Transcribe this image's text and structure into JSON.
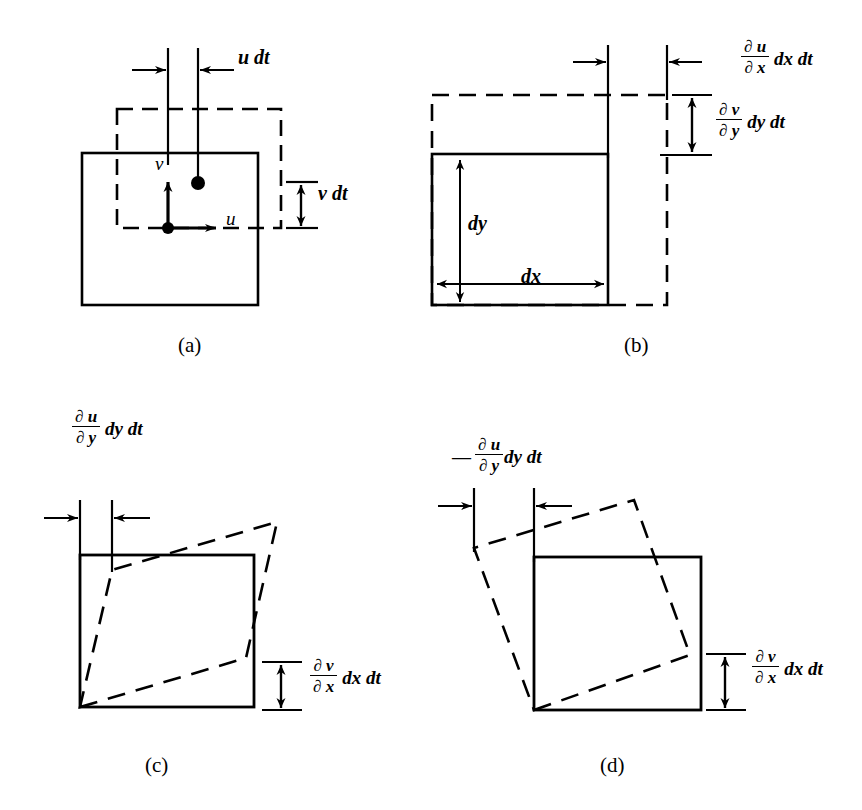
{
  "figure": {
    "background_color": "#ffffff",
    "ink_color": "#000000"
  },
  "panels": [
    {
      "id": "a",
      "caption": "(a)",
      "caption_pos": {
        "x": 178,
        "y": 345
      },
      "description": "translation",
      "solid_square": {
        "x": 82,
        "y": 153,
        "w": 176,
        "h": 152
      },
      "dashed_square": {
        "x": 117,
        "y": 109,
        "w": 164,
        "h": 119
      },
      "velocity_origin": {
        "x": 168,
        "y": 228
      },
      "displaced_point": {
        "x": 198,
        "y": 183
      },
      "labels": [
        {
          "name": "u-dt-label",
          "text": "u dt",
          "x": 238,
          "y": 56,
          "kind": "simple"
        },
        {
          "name": "v-dt-label",
          "text": "v dt",
          "x": 318,
          "y": 193,
          "kind": "simple"
        },
        {
          "name": "u-velocity-label",
          "text": "u",
          "x": 226,
          "y": 218,
          "kind": "vector"
        },
        {
          "name": "v-velocity-label",
          "text": "v",
          "x": 156,
          "y": 163,
          "kind": "vector"
        }
      ]
    },
    {
      "id": "b",
      "caption": "(b)",
      "caption_pos": {
        "x": 624,
        "y": 345
      },
      "description": "linear deformation",
      "solid_square": {
        "x": 432,
        "y": 154,
        "w": 176,
        "h": 151
      },
      "dashed_square": {
        "x": 432,
        "y": 95,
        "w": 235,
        "h": 210
      },
      "labels": [
        {
          "name": "du-dx-dxdt-label",
          "numerator": "∂ u",
          "denominator": "∂ x",
          "tail": "dx dt",
          "x": 741,
          "y": 47,
          "kind": "fraction"
        },
        {
          "name": "dv-dy-dydt-label",
          "numerator": "∂ v",
          "denominator": "∂ y",
          "tail": "dy dt",
          "x": 716,
          "y": 110,
          "kind": "fraction"
        },
        {
          "name": "dy-dimension-label",
          "text": "dy",
          "x": 452,
          "y": 222,
          "kind": "simple"
        },
        {
          "name": "dx-dimension-label",
          "text": "dx",
          "x": 521,
          "y": 276,
          "kind": "simple"
        }
      ]
    },
    {
      "id": "c",
      "caption": "(c)",
      "caption_pos": {
        "x": 145,
        "y": 765
      },
      "description": "angular deformation",
      "solid_square": {
        "x": 80,
        "y": 555,
        "w": 174,
        "h": 152
      },
      "dashed_quad": [
        {
          "x": 80,
          "y": 707
        },
        {
          "x": 246,
          "y": 658
        },
        {
          "x": 277,
          "y": 522
        },
        {
          "x": 112,
          "y": 570
        }
      ],
      "labels": [
        {
          "name": "du-dy-dydt-label",
          "numerator": "∂ u",
          "denominator": "∂ y",
          "tail": "dy dt",
          "x": 82,
          "y": 418,
          "kind": "fraction"
        },
        {
          "name": "dv-dx-dxdt-label",
          "numerator": "∂ v",
          "denominator": "∂ x",
          "tail": "dx dt",
          "x": 310,
          "y": 665,
          "kind": "fraction"
        }
      ]
    },
    {
      "id": "d",
      "caption": "(d)",
      "caption_pos": {
        "x": 600,
        "y": 765
      },
      "description": "rotation",
      "solid_square": {
        "x": 534,
        "y": 557,
        "w": 167,
        "h": 153
      },
      "dashed_quad": [
        {
          "x": 534,
          "y": 710
        },
        {
          "x": 690,
          "y": 655
        },
        {
          "x": 634,
          "y": 500
        },
        {
          "x": 474,
          "y": 548
        }
      ],
      "labels": [
        {
          "name": "neg-du-dy-dydt-label",
          "minus": "—",
          "numerator": "∂ u",
          "denominator": "∂ y",
          "tail": "dy dt",
          "x": 458,
          "y": 446,
          "kind": "fraction-minus"
        },
        {
          "name": "dv-dx-dxdt-label",
          "numerator": "∂ v",
          "denominator": "∂ x",
          "tail": "dx dt",
          "x": 752,
          "y": 656,
          "kind": "fraction"
        }
      ]
    }
  ],
  "symbols": {
    "partial": "∂",
    "u": "u",
    "v": "v",
    "dx": "dx",
    "dy": "dy",
    "dt": "dt"
  }
}
